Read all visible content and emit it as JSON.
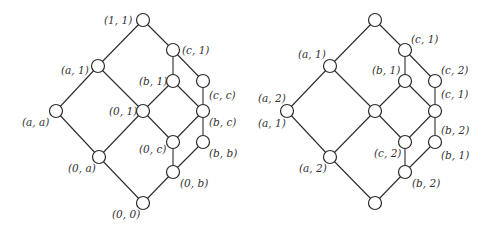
{
  "diagrams": [
    {
      "id": "left-lattice",
      "nodes": [
        {
          "id": "n11",
          "x": 143,
          "y": 20,
          "label": "(1, 1)",
          "lx": 104,
          "ly": 24
        },
        {
          "id": "nc1",
          "x": 173,
          "y": 50,
          "label": "(c, 1)",
          "lx": 182,
          "ly": 54
        },
        {
          "id": "na1",
          "x": 98,
          "y": 66,
          "label": "(a, 1)",
          "lx": 61,
          "ly": 74
        },
        {
          "id": "nb1",
          "x": 173,
          "y": 81,
          "label": "(b, 1)",
          "lx": 139,
          "ly": 85
        },
        {
          "id": "ncc",
          "x": 203,
          "y": 81,
          "label": "(c, c)",
          "lx": 209,
          "ly": 99
        },
        {
          "id": "naa",
          "x": 56,
          "y": 111,
          "label": "(a, a)",
          "lx": 22,
          "ly": 126
        },
        {
          "id": "n01",
          "x": 143,
          "y": 111,
          "label": "(0, 1)",
          "lx": 109,
          "ly": 115
        },
        {
          "id": "nbc",
          "x": 203,
          "y": 111,
          "label": "(b, c)",
          "lx": 209,
          "ly": 126
        },
        {
          "id": "n0c",
          "x": 173,
          "y": 142,
          "label": "(0, c)",
          "lx": 139,
          "ly": 153
        },
        {
          "id": "nbb",
          "x": 203,
          "y": 142,
          "label": "(b, b)",
          "lx": 209,
          "ly": 157
        },
        {
          "id": "n0a",
          "x": 99,
          "y": 157,
          "label": "(0, a)",
          "lx": 68,
          "ly": 172
        },
        {
          "id": "n0b",
          "x": 173,
          "y": 172,
          "label": "(0, b)",
          "lx": 180,
          "ly": 187
        },
        {
          "id": "n00",
          "x": 143,
          "y": 203,
          "label": "(0, 0)",
          "lx": 112,
          "ly": 218
        }
      ],
      "edges": [
        [
          "n11",
          "na1"
        ],
        [
          "n11",
          "nc1"
        ],
        [
          "nc1",
          "nb1"
        ],
        [
          "nc1",
          "ncc"
        ],
        [
          "na1",
          "naa"
        ],
        [
          "na1",
          "n01"
        ],
        [
          "nb1",
          "n01"
        ],
        [
          "nb1",
          "nbc"
        ],
        [
          "ncc",
          "nbc"
        ],
        [
          "naa",
          "n0a"
        ],
        [
          "n01",
          "n0a"
        ],
        [
          "n01",
          "n0c"
        ],
        [
          "nbc",
          "n0c"
        ],
        [
          "nbc",
          "nbb"
        ],
        [
          "n0c",
          "n0b"
        ],
        [
          "nbb",
          "n0b"
        ],
        [
          "n0a",
          "n00"
        ],
        [
          "n0b",
          "n00"
        ]
      ]
    },
    {
      "id": "right-lattice",
      "nodes": [
        {
          "id": "r_top",
          "x": 375,
          "y": 20,
          "label": "",
          "lx": 0,
          "ly": 0
        },
        {
          "id": "r_c1",
          "x": 405,
          "y": 50,
          "label": "(c, 1)",
          "lx": 411,
          "ly": 43
        },
        {
          "id": "r_a1",
          "x": 330,
          "y": 66,
          "label": "(a, 1)",
          "lx": 298,
          "ly": 58
        },
        {
          "id": "r_b1",
          "x": 405,
          "y": 81,
          "label": "(b, 1)",
          "lx": 372,
          "ly": 74
        },
        {
          "id": "r_c2",
          "x": 435,
          "y": 81,
          "label": "(c, 2)",
          "lx": 441,
          "ly": 74
        },
        {
          "id": "r_a2",
          "x": 287,
          "y": 111,
          "label": "(a, 2)",
          "lx": 258,
          "ly": 102
        },
        {
          "id": "r_mid",
          "x": 375,
          "y": 111,
          "label": "",
          "lx": 0,
          "ly": 0
        },
        {
          "id": "r_rc",
          "x": 435,
          "y": 111,
          "label": "(c, 1)",
          "lx": 441,
          "ly": 98
        },
        {
          "id": "r_c2b",
          "x": 405,
          "y": 142,
          "label": "(c, 2)",
          "lx": 374,
          "ly": 157
        },
        {
          "id": "r_rb1",
          "x": 435,
          "y": 142,
          "label": "(b, 1)",
          "lx": 441,
          "ly": 159
        },
        {
          "id": "r_a2b",
          "x": 330,
          "y": 157,
          "label": "(a, 2)",
          "lx": 299,
          "ly": 172
        },
        {
          "id": "r_b2",
          "x": 405,
          "y": 172,
          "label": "(b, 2)",
          "lx": 412,
          "ly": 187
        },
        {
          "id": "r_bot",
          "x": 375,
          "y": 203,
          "label": "",
          "lx": 0,
          "ly": 0
        }
      ],
      "extra_labels": [
        {
          "label": "(a, 1)",
          "x": 258,
          "y": 127
        },
        {
          "label": "(b, 2)",
          "x": 441,
          "y": 134
        }
      ],
      "edges": [
        [
          "r_top",
          "r_a1"
        ],
        [
          "r_top",
          "r_c1"
        ],
        [
          "r_c1",
          "r_b1"
        ],
        [
          "r_c1",
          "r_c2"
        ],
        [
          "r_a1",
          "r_a2"
        ],
        [
          "r_a1",
          "r_mid"
        ],
        [
          "r_b1",
          "r_mid"
        ],
        [
          "r_b1",
          "r_rc"
        ],
        [
          "r_c2",
          "r_rc"
        ],
        [
          "r_a2",
          "r_a2b"
        ],
        [
          "r_mid",
          "r_a2b"
        ],
        [
          "r_mid",
          "r_c2b"
        ],
        [
          "r_rc",
          "r_c2b"
        ],
        [
          "r_rc",
          "r_rb1"
        ],
        [
          "r_c2b",
          "r_b2"
        ],
        [
          "r_rb1",
          "r_b2"
        ],
        [
          "r_a2b",
          "r_bot"
        ],
        [
          "r_b2",
          "r_bot"
        ]
      ]
    }
  ],
  "style": {
    "node_radius": 6.5,
    "stroke_color": "#2b2b2b",
    "label_color": "#333333"
  }
}
